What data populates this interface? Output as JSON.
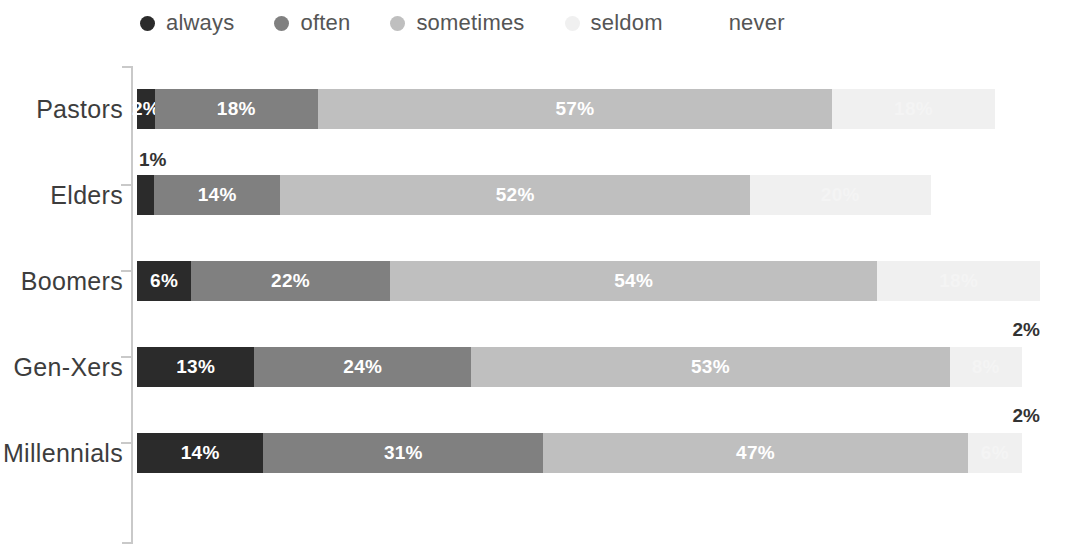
{
  "legend": {
    "items": [
      {
        "label": "always",
        "color": "#2b2b2b",
        "icon": "legend-dot"
      },
      {
        "label": "often",
        "color": "#808080",
        "icon": "legend-dot"
      },
      {
        "label": "sometimes",
        "color": "#bfbfbf",
        "icon": "legend-dot"
      },
      {
        "label": "seldom",
        "color": "#f0f0f0",
        "icon": "legend-dot"
      },
      {
        "label": "never",
        "color": "#ffffff",
        "icon": "legend-dot"
      }
    ]
  },
  "colors": {
    "always": "#2b2b2b",
    "often": "#808080",
    "sometimes": "#bfbfbf",
    "seldom": "#f0f0f0",
    "never": "#ffffff",
    "axis": "#c9c9c9",
    "label_text": "#3d3d3d",
    "value_text": "#ffffff",
    "external_text": "#333333"
  },
  "chart_data": {
    "type": "bar",
    "subtype": "horizontal-stacked-percent",
    "title": "",
    "xlabel": "",
    "ylabel": "",
    "xlim": [
      0,
      100
    ],
    "grid": false,
    "legend_position": "top",
    "categories": [
      "Pastors",
      "Elders",
      "Boomers",
      "Gen-Xers",
      "Millennials"
    ],
    "series": [
      {
        "name": "always",
        "values": [
          2,
          1,
          6,
          13,
          14
        ]
      },
      {
        "name": "often",
        "values": [
          18,
          14,
          22,
          24,
          31
        ]
      },
      {
        "name": "sometimes",
        "values": [
          57,
          52,
          54,
          53,
          47
        ]
      },
      {
        "name": "seldom",
        "values": [
          18,
          20,
          18,
          8,
          6
        ]
      },
      {
        "name": "never",
        "values": [
          0,
          0,
          0,
          2,
          2
        ]
      }
    ],
    "rows": [
      {
        "category": "Pastors",
        "segments": [
          {
            "series": "always",
            "value": 2,
            "label": "2%",
            "label_placement": "inside",
            "label_style": "white"
          },
          {
            "series": "often",
            "value": 18,
            "label": "18%",
            "label_placement": "inside",
            "label_style": "white"
          },
          {
            "series": "sometimes",
            "value": 57,
            "label": "57%",
            "label_placement": "inside",
            "label_style": "white"
          },
          {
            "series": "seldom",
            "value": 18,
            "label": "18%",
            "label_placement": "inside",
            "label_style": "dim"
          },
          {
            "series": "never",
            "value": 0,
            "label": "",
            "label_placement": "none",
            "label_style": "none"
          }
        ]
      },
      {
        "category": "Elders",
        "segments": [
          {
            "series": "always",
            "value": 1,
            "label": "1%",
            "label_placement": "above-left",
            "label_style": "dark"
          },
          {
            "series": "often",
            "value": 14,
            "label": "14%",
            "label_placement": "inside",
            "label_style": "white"
          },
          {
            "series": "sometimes",
            "value": 52,
            "label": "52%",
            "label_placement": "inside",
            "label_style": "white"
          },
          {
            "series": "seldom",
            "value": 20,
            "label": "20%",
            "label_placement": "inside",
            "label_style": "dim"
          },
          {
            "series": "never",
            "value": 0,
            "label": "",
            "label_placement": "none",
            "label_style": "none"
          }
        ]
      },
      {
        "category": "Boomers",
        "segments": [
          {
            "series": "always",
            "value": 6,
            "label": "6%",
            "label_placement": "inside",
            "label_style": "white"
          },
          {
            "series": "often",
            "value": 22,
            "label": "22%",
            "label_placement": "inside",
            "label_style": "white"
          },
          {
            "series": "sometimes",
            "value": 54,
            "label": "54%",
            "label_placement": "inside",
            "label_style": "white"
          },
          {
            "series": "seldom",
            "value": 18,
            "label": "18%",
            "label_placement": "inside",
            "label_style": "dim"
          },
          {
            "series": "never",
            "value": 0,
            "label": "",
            "label_placement": "none",
            "label_style": "none"
          }
        ]
      },
      {
        "category": "Gen-Xers",
        "segments": [
          {
            "series": "always",
            "value": 13,
            "label": "13%",
            "label_placement": "inside",
            "label_style": "white"
          },
          {
            "series": "often",
            "value": 24,
            "label": "24%",
            "label_placement": "inside",
            "label_style": "white"
          },
          {
            "series": "sometimes",
            "value": 53,
            "label": "53%",
            "label_placement": "inside",
            "label_style": "white"
          },
          {
            "series": "seldom",
            "value": 8,
            "label": "8%",
            "label_placement": "inside",
            "label_style": "dim"
          },
          {
            "series": "never",
            "value": 2,
            "label": "2%",
            "label_placement": "above-right",
            "label_style": "dark"
          }
        ]
      },
      {
        "category": "Millennials",
        "segments": [
          {
            "series": "always",
            "value": 14,
            "label": "14%",
            "label_placement": "inside",
            "label_style": "white"
          },
          {
            "series": "often",
            "value": 31,
            "label": "31%",
            "label_placement": "inside",
            "label_style": "white"
          },
          {
            "series": "sometimes",
            "value": 47,
            "label": "47%",
            "label_placement": "inside",
            "label_style": "white"
          },
          {
            "series": "seldom",
            "value": 6,
            "label": "6%",
            "label_placement": "inside",
            "label_style": "dim"
          },
          {
            "series": "never",
            "value": 2,
            "label": "2%",
            "label_placement": "above-right",
            "label_style": "dark"
          }
        ]
      }
    ]
  }
}
